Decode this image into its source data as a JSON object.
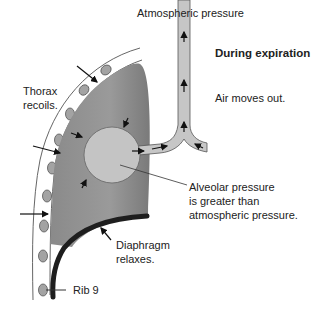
{
  "diagram": {
    "title": "During expiration",
    "labels": {
      "atmospheric": "Atmospheric pressure",
      "phase": "During expiration",
      "air": "Air moves out.",
      "thorax_line1": "Thorax",
      "thorax_line2": "recoils.",
      "alveolar_line1": "Alveolar pressure",
      "alveolar_line2": "is greater than",
      "alveolar_line3": "atmospheric pressure.",
      "diaphragm_line1": "Diaphragm",
      "diaphragm_line2": "relaxes.",
      "rib": "Rib 9"
    },
    "colors": {
      "lung": "#8c8c8c",
      "alveolus": "#c4c4c4",
      "airway": "#c6c6c6",
      "rib": "#a0a0a0",
      "diaphragm": "#1e1e1e",
      "line": "#333333"
    }
  }
}
